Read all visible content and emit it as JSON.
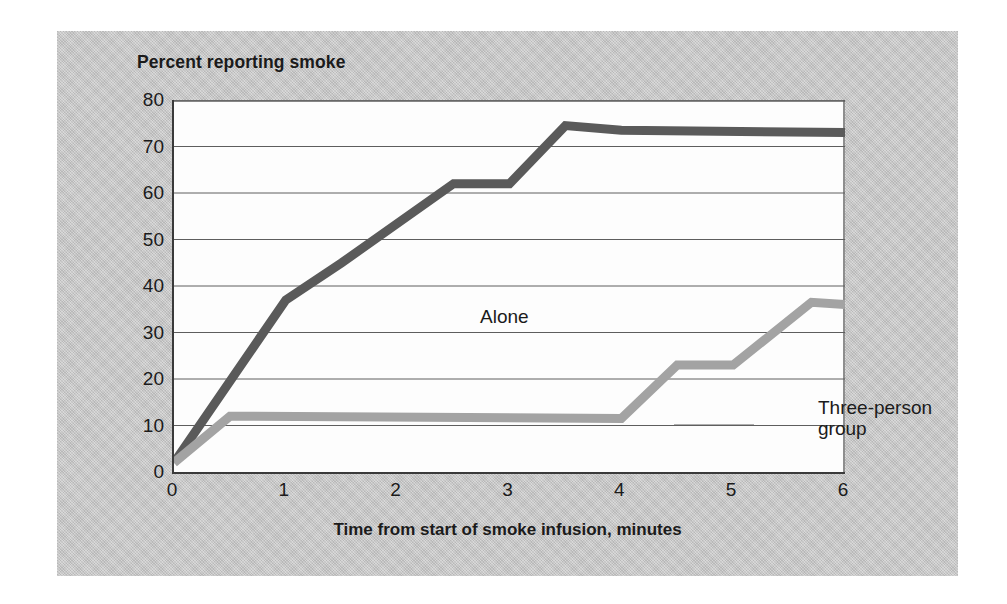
{
  "figure": {
    "panel_color": "#c9c9c9",
    "plot_background": "#fdfdfd",
    "axis_color": "#3a3a3a",
    "gridline_color": "#5e5e5e"
  },
  "chart_data": {
    "type": "line",
    "title": "Percent reporting smoke",
    "xlabel": "Time from start of smoke infusion, minutes",
    "ylabel": "Percent reporting smoke",
    "xlim": [
      0,
      6
    ],
    "ylim": [
      0,
      80
    ],
    "xticks": [
      0,
      1,
      2,
      3,
      4,
      5,
      6
    ],
    "xtick_labels": [
      "0",
      "1",
      "2",
      "3",
      "4",
      "5",
      "6"
    ],
    "yticks": [
      0,
      10,
      20,
      30,
      40,
      50,
      60,
      70,
      80
    ],
    "ytick_labels": [
      "0",
      "10",
      "20",
      "30",
      "40",
      "50",
      "60",
      "70",
      "80"
    ],
    "grid": "horizontal",
    "legend": "inline-annotations",
    "series": [
      {
        "name": "Alone",
        "color": "#5a5a5a",
        "label_text": "Alone",
        "x": [
          0,
          1,
          1.5,
          2.5,
          3,
          3.5,
          4,
          6
        ],
        "values": [
          2,
          37,
          45,
          62,
          62,
          74.5,
          73.5,
          73
        ]
      },
      {
        "name": "Three-person group",
        "color": "#a3a3a3",
        "label_text": "Three-person\ngroup",
        "x": [
          0,
          0.5,
          4,
          4.5,
          5,
          5.7,
          6
        ],
        "values": [
          2,
          12,
          11.5,
          23,
          23,
          36.5,
          36
        ]
      }
    ]
  },
  "annotations": {
    "alone": "Alone",
    "group_line1": "Three-person",
    "group_line2": "group"
  }
}
